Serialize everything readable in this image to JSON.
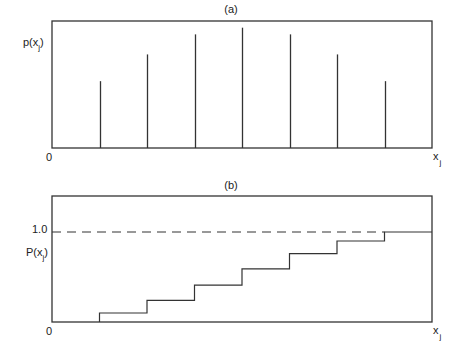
{
  "chart_data": [
    {
      "type": "bar",
      "subtype": "stem",
      "title": "(a)",
      "ylabel": "p(x",
      "ylabel_sub": "j",
      "ylabel_close": ")",
      "xlabel": "x",
      "xlabel_sub": "j",
      "origin_label": "0",
      "x": [
        1,
        2,
        3,
        4,
        5,
        6,
        7
      ],
      "values": [
        0.1,
        0.14,
        0.17,
        0.18,
        0.17,
        0.14,
        0.1
      ],
      "ylim": [
        0,
        0.19
      ],
      "xlim": [
        0,
        8
      ],
      "grid": false
    },
    {
      "type": "line",
      "subtype": "step",
      "title": "(b)",
      "ylabel": "P(x",
      "ylabel_sub": "j",
      "ylabel_close": ")",
      "xlabel": "x",
      "xlabel_sub": "j",
      "origin_label": "0",
      "ytick_label": "1.0",
      "reference_line": {
        "y": 1.0,
        "style": "dashed"
      },
      "x": [
        1,
        2,
        3,
        4,
        5,
        6,
        7
      ],
      "values": [
        0.1,
        0.24,
        0.41,
        0.59,
        0.76,
        0.9,
        1.0
      ],
      "ylim": [
        0,
        1.4
      ],
      "xlim": [
        0,
        8
      ],
      "grid": false
    }
  ]
}
